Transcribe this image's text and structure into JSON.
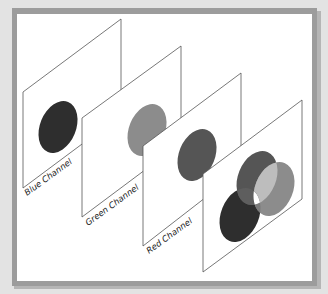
{
  "diagram": {
    "frame": {
      "background": "#e3e3e3",
      "border": "#9a9a9a",
      "paper": "#ffffff"
    },
    "panels": [
      {
        "name": "blue-channel",
        "label": "Blue Channel",
        "ellipse_color": "#2e2e2e"
      },
      {
        "name": "green-channel",
        "label": "Green Channel",
        "ellipse_color": "#8c8c8c"
      },
      {
        "name": "red-channel",
        "label": "Red Channel",
        "ellipse_color": "#555555"
      },
      {
        "name": "combined",
        "label": "",
        "colors": {
          "blue": "#2e2e2e",
          "red": "#555555",
          "green": "#8c8c8c",
          "overlap_red_green": "#bdbdbd",
          "overlap_all": "#ffffff"
        }
      }
    ]
  }
}
